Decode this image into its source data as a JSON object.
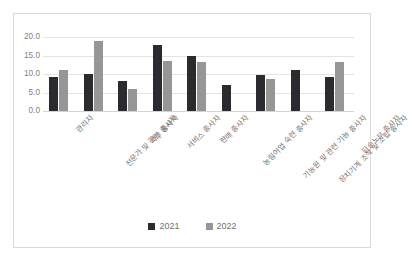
{
  "chart_data": {
    "type": "bar",
    "title": "",
    "xlabel": "",
    "ylabel": "",
    "ylim": [
      0,
      20
    ],
    "ytick_labels": [
      "20.0",
      "15.0",
      "10.0",
      "5.0",
      "0.0"
    ],
    "yticks": [
      20,
      15,
      10,
      5,
      0
    ],
    "grid": true,
    "legend_position": "bottom",
    "categories": [
      "관리자",
      "전문가 및 관련 종사자",
      "사무 종사자",
      "서비스 종사자",
      "판매 종사자",
      "농림어업 숙련 종사자",
      "기능원 및 관련 기능 종사자",
      "장치기계 조작 및 조립 종사자",
      "단순노무 종사자"
    ],
    "series": [
      {
        "name": "2021",
        "color": "#2b2b2f",
        "values": [
          9.3,
          10.1,
          8.0,
          17.8,
          15.0,
          7.0,
          9.8,
          11.0,
          9.3
        ]
      },
      {
        "name": "2022",
        "color": "#969696",
        "values": [
          11.1,
          18.9,
          5.9,
          13.5,
          13.3,
          null,
          8.7,
          null,
          13.3
        ]
      }
    ]
  },
  "legend": {
    "items": [
      {
        "label": "2021",
        "color": "#2b2b2f"
      },
      {
        "label": "2022",
        "color": "#969696"
      }
    ]
  },
  "colors": {
    "series_2021": "#2b2b2f",
    "series_2022": "#969696",
    "gridline": "#e3e3e3",
    "frame_border": "#d9d9d9",
    "tick_text": "#7f7f7f",
    "background": "#ffffff"
  }
}
